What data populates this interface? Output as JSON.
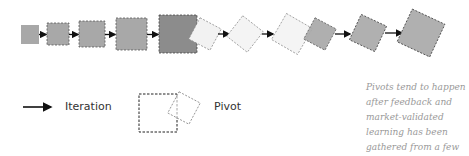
{
  "diagram": {
    "colors": {
      "dark_fill": "#8c8c8c",
      "mid_fill": "#a8a8a8",
      "light_fill": "#f2f2f2",
      "stroke": "#444444",
      "light_stroke": "#888888",
      "arrow": "#111111"
    },
    "shapes": [
      {
        "id": "box-1",
        "type": "square",
        "fill": "#a8a8a8",
        "dashed": false
      },
      {
        "id": "box-2",
        "type": "square",
        "fill": "#a8a8a8",
        "dashed": true
      },
      {
        "id": "box-3",
        "type": "square",
        "fill": "#a8a8a8",
        "dashed": true
      },
      {
        "id": "box-4",
        "type": "square",
        "fill": "#a8a8a8",
        "dashed": true
      },
      {
        "id": "box-5",
        "type": "square",
        "fill": "#8c8c8c",
        "dashed": true
      },
      {
        "id": "pivot-1",
        "type": "rotated-square",
        "fill": "#f2f2f2",
        "dashed": true
      },
      {
        "id": "pivot-2",
        "type": "rotated-square",
        "fill": "#f2f2f2",
        "dashed": true
      },
      {
        "id": "pivot-3",
        "type": "rotated-square",
        "fill": "#f2f2f2",
        "dashed": true
      },
      {
        "id": "pivot-4",
        "type": "rotated-square",
        "fill": "#a8a8a8",
        "dashed": true
      },
      {
        "id": "pivot-5",
        "type": "rotated-square",
        "fill": "#b0b0b0",
        "dashed": true
      },
      {
        "id": "pivot-6",
        "type": "rotated-square",
        "fill": "#b0b0b0",
        "dashed": true
      }
    ]
  },
  "legend": {
    "iteration_label": "Iteration",
    "pivot_label": "Pivot"
  },
  "note": {
    "text": "Pivots tend to happen after feedback and market-validated learning has been gathered from a few iterations"
  }
}
